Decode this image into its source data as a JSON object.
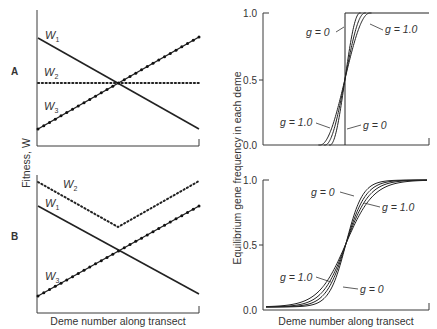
{
  "chart_data": [
    {
      "type": "line",
      "panel": "A",
      "ylabel": "Fitness, W",
      "xlabel": "",
      "x": [
        0,
        1
      ],
      "series": [
        {
          "name": "W1",
          "style": "solid",
          "values": [
            0.8,
            0.13
          ]
        },
        {
          "name": "W2",
          "style": "dotted",
          "values": [
            0.47,
            0.47
          ]
        },
        {
          "name": "W3",
          "style": "beaded",
          "values": [
            0.13,
            0.8
          ]
        }
      ],
      "ylim": [
        -0.07,
        1
      ]
    },
    {
      "type": "line",
      "panel": "B",
      "ylabel": "Fitness, W",
      "xlabel": "Deme number along transect",
      "x": [
        0,
        0.5,
        1
      ],
      "series": [
        {
          "name": "W2",
          "style": "dotted",
          "values": [
            0.95,
            0.62,
            0.95
          ]
        },
        {
          "name": "W1",
          "style": "solid",
          "values": [
            0.78,
            0.42,
            0.13
          ]
        },
        {
          "name": "W3",
          "style": "beaded",
          "values": [
            0.13,
            0.42,
            0.78
          ]
        }
      ],
      "ylim": [
        0,
        1
      ]
    },
    {
      "type": "line",
      "panel": "A",
      "ylabel": "Equilibrium gene frequency in each deme",
      "xlabel": "",
      "yticks": [
        "0.0",
        "0.5",
        "1.0"
      ],
      "ylim": [
        0,
        1
      ],
      "description": "Clines of gene frequency for different g; g = 0 is a step function at the center, g = 1.0 is the widest curve",
      "series": [
        {
          "name": "g = 0",
          "width": 0
        },
        {
          "name": "g (intermediate 1)",
          "width": 0.06
        },
        {
          "name": "g (intermediate 2)",
          "width": 0.08
        },
        {
          "name": "g = 1.0",
          "width": 0.1
        }
      ],
      "annotations": [
        {
          "text": "g = 0",
          "target": "step curve (upper)"
        },
        {
          "text": "g = 1.0",
          "target": "widest curve (upper)"
        },
        {
          "text": "g = 1.0",
          "target": "widest curve (lower)"
        },
        {
          "text": "g = 0",
          "target": "step curve (lower)"
        }
      ]
    },
    {
      "type": "line",
      "panel": "B",
      "ylabel": "Equilibrium gene frequency in each deme",
      "xlabel": "Deme number along transect",
      "yticks": [
        "0.0",
        "0.5",
        "1.0"
      ],
      "ylim": [
        0,
        1
      ],
      "description": "Sigmoid clines; g = 0 is the steepest, g = 1.0 the shallowest in the center",
      "series": [
        {
          "name": "g = 0",
          "steepness": 1.0
        },
        {
          "name": "g (intermediate 1)",
          "steepness": 0.85
        },
        {
          "name": "g (intermediate 2)",
          "steepness": 0.72
        },
        {
          "name": "g = 1.0",
          "steepness": 0.62
        }
      ],
      "annotations": [
        {
          "text": "g = 0",
          "target": "steepest curve (upper)"
        },
        {
          "text": "g = 1.0",
          "target": "shallowest curve (upper)"
        },
        {
          "text": "g = 1.0",
          "target": "shallowest curve (lower)"
        },
        {
          "text": "g = 0",
          "target": "steepest curve (lower)"
        }
      ]
    }
  ],
  "labels": {
    "panel_a": "A",
    "panel_b": "B",
    "fitness_axis": "Fitness, W",
    "freq_axis": "Equilibrium gene frequency in each deme",
    "x_axis": "Deme number along transect",
    "w": "W",
    "w1_sub": "1",
    "w2_sub": "2",
    "w3_sub": "3",
    "g0": "g = 0",
    "g1": "g = 1.0",
    "tick_0": "0.0",
    "tick_05": "0.5",
    "tick_1": "1.0"
  }
}
